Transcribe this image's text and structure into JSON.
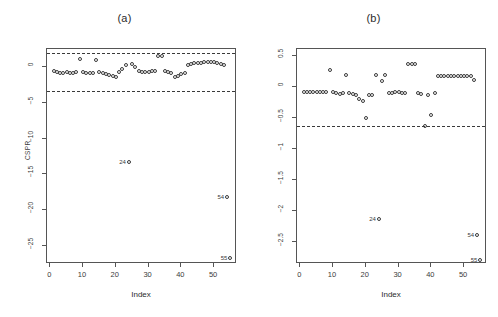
{
  "figure": {
    "xlabel": "Index",
    "panels": [
      {
        "title": "(a)",
        "ylabel": "CSPR",
        "ytick_labels": [
          "0",
          "-5",
          "-10",
          "-15",
          "-20",
          "-25"
        ],
        "xtick_labels": [
          "0",
          "10",
          "20",
          "30",
          "40",
          "50"
        ]
      },
      {
        "title": "(b)",
        "ylabel": "DFFITS",
        "ytick_labels": [
          "0.5",
          "0.0",
          "-0.5",
          "-1.0",
          "-1.5",
          "-2.0",
          "-2.5"
        ],
        "xtick_labels": [
          "0",
          "10",
          "20",
          "30",
          "40",
          "50"
        ]
      }
    ]
  },
  "chart_data": [
    {
      "type": "scatter",
      "title": "(a)",
      "xlabel": "Index",
      "ylabel": "CSPR",
      "xlim": [
        -1,
        57
      ],
      "ylim": [
        -27.5,
        2.5
      ],
      "xticks": [
        0,
        10,
        20,
        30,
        40,
        50
      ],
      "yticks": [
        0,
        -5,
        -10,
        -15,
        -20,
        -25
      ],
      "grid": false,
      "legend": "none",
      "reference_lines": [
        {
          "y": 2.0,
          "style": "dashed"
        },
        {
          "y": -3.4,
          "style": "dashed"
        }
      ],
      "annotations": [
        {
          "text": "24",
          "x": 24,
          "y": -13.2
        },
        {
          "text": "54",
          "x": 54,
          "y": -18.2
        },
        {
          "text": "55",
          "x": 55,
          "y": -26.6
        }
      ],
      "x": [
        1,
        2,
        3,
        4,
        5,
        6,
        7,
        8,
        9,
        10,
        11,
        12,
        13,
        14,
        15,
        16,
        17,
        18,
        19,
        20,
        21,
        22,
        23,
        24,
        25,
        26,
        27,
        28,
        29,
        30,
        31,
        32,
        33,
        34,
        35,
        36,
        37,
        38,
        39,
        40,
        41,
        42,
        43,
        44,
        45,
        46,
        47,
        48,
        49,
        50,
        51,
        52,
        53,
        54,
        55
      ],
      "y": [
        -0.55,
        -0.75,
        -0.85,
        -0.8,
        -0.75,
        -0.85,
        -0.8,
        -0.75,
        1.05,
        -0.7,
        -0.85,
        -0.8,
        -0.85,
        0.95,
        -0.75,
        -0.9,
        -0.95,
        -1.1,
        -1.25,
        -1.45,
        -0.7,
        -0.35,
        0.2,
        -13.2,
        0.45,
        0.05,
        -0.6,
        -0.7,
        -0.65,
        -0.7,
        -0.6,
        -0.55,
        1.55,
        1.5,
        -0.6,
        -0.7,
        -0.85,
        -1.35,
        -1.25,
        -1.05,
        -0.85,
        0.3,
        0.45,
        0.5,
        0.55,
        0.6,
        0.65,
        0.7,
        0.7,
        0.65,
        0.6,
        0.45,
        0.25,
        -18.2,
        -26.6
      ]
    },
    {
      "type": "scatter",
      "title": "(b)",
      "xlabel": "Index",
      "ylabel": "DFFITS",
      "xlim": [
        -1,
        57
      ],
      "ylim": [
        -2.85,
        0.62
      ],
      "xticks": [
        0,
        10,
        20,
        30,
        40,
        50
      ],
      "yticks": [
        0.5,
        0.0,
        -0.5,
        -1.0,
        -1.5,
        -2.0,
        -2.5
      ],
      "grid": false,
      "legend": "none",
      "reference_lines": [
        {
          "y": -0.62,
          "style": "dashed"
        }
      ],
      "annotations": [
        {
          "text": "24",
          "x": 24,
          "y": -2.12
        },
        {
          "text": "54",
          "x": 54,
          "y": -2.38
        },
        {
          "text": "55",
          "x": 55,
          "y": -2.78
        }
      ],
      "x": [
        1,
        2,
        3,
        4,
        5,
        6,
        7,
        8,
        9,
        10,
        11,
        12,
        13,
        14,
        15,
        16,
        17,
        18,
        19,
        20,
        21,
        22,
        23,
        24,
        25,
        26,
        27,
        28,
        29,
        30,
        31,
        32,
        33,
        34,
        35,
        36,
        37,
        38,
        39,
        40,
        41,
        42,
        43,
        44,
        45,
        46,
        47,
        48,
        49,
        50,
        51,
        52,
        53,
        54,
        55
      ],
      "y": [
        -0.08,
        -0.08,
        -0.08,
        -0.08,
        -0.08,
        -0.08,
        -0.08,
        -0.08,
        0.28,
        -0.08,
        -0.09,
        -0.1,
        -0.09,
        0.2,
        -0.09,
        -0.1,
        -0.12,
        -0.18,
        -0.22,
        -0.5,
        -0.13,
        -0.12,
        0.2,
        -2.12,
        0.1,
        0.2,
        -0.09,
        -0.09,
        -0.08,
        -0.08,
        -0.09,
        -0.09,
        0.37,
        0.38,
        0.37,
        -0.09,
        -0.1,
        -0.62,
        -0.13,
        -0.44,
        -0.09,
        0.18,
        0.18,
        0.18,
        0.18,
        0.18,
        0.18,
        0.18,
        0.18,
        0.18,
        0.18,
        0.18,
        0.12,
        -2.38,
        -2.78
      ]
    }
  ]
}
